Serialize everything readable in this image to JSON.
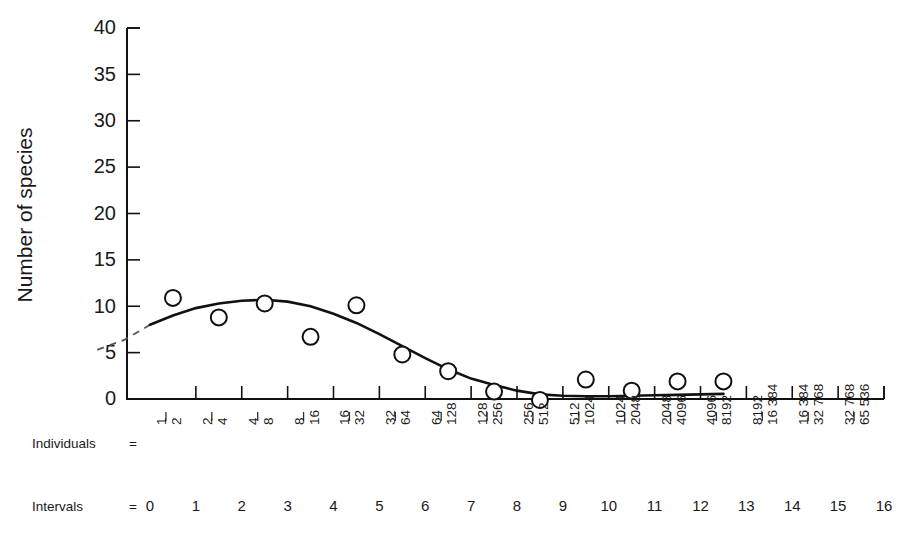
{
  "chart_data": {
    "type": "scatter",
    "title": "",
    "subtitle": "",
    "xlabel": "Intervals",
    "ylabel": "Number of species",
    "ylim": [
      0,
      40
    ],
    "yticks": [
      0,
      5,
      10,
      15,
      20,
      25,
      30,
      35,
      40
    ],
    "xlim": [
      0,
      16
    ],
    "grid": false,
    "legend": null,
    "x_axis_rows": [
      {
        "name": "individuals",
        "label": "Individuals",
        "equals": "=",
        "ticklabels": [
          {
            "upper": "1",
            "lower": "2"
          },
          {
            "upper": "2",
            "lower": "4"
          },
          {
            "upper": "4",
            "lower": "8"
          },
          {
            "upper": "8",
            "lower": "16"
          },
          {
            "upper": "16",
            "lower": "32"
          },
          {
            "upper": "32",
            "lower": "64"
          },
          {
            "upper": "64",
            "lower": "128"
          },
          {
            "upper": "128",
            "lower": "256"
          },
          {
            "upper": "256",
            "lower": "512"
          },
          {
            "upper": "512",
            "lower": "1024"
          },
          {
            "upper": "1024",
            "lower": "2048"
          },
          {
            "upper": "2048",
            "lower": "4096"
          },
          {
            "upper": "4096",
            "lower": "8192"
          },
          {
            "upper": "8192",
            "lower": "16 384"
          },
          {
            "upper": "16 384",
            "lower": "32 768"
          },
          {
            "upper": "32 768",
            "lower": "65 536"
          }
        ]
      },
      {
        "name": "intervals",
        "label": "Intervals",
        "equals": "=",
        "ticklabels": [
          "0",
          "1",
          "2",
          "3",
          "4",
          "5",
          "6",
          "7",
          "8",
          "9",
          "10",
          "11",
          "12",
          "13",
          "14",
          "15",
          "16"
        ]
      }
    ],
    "series": [
      {
        "name": "observed species counts",
        "marker": "open-circle",
        "points": [
          {
            "x": 0.5,
            "y": 10.9
          },
          {
            "x": 1.5,
            "y": 8.8
          },
          {
            "x": 2.5,
            "y": 10.3
          },
          {
            "x": 3.5,
            "y": 6.7
          },
          {
            "x": 4.5,
            "y": 10.1
          },
          {
            "x": 5.5,
            "y": 4.8
          },
          {
            "x": 6.5,
            "y": 3.0
          },
          {
            "x": 7.5,
            "y": 0.8
          },
          {
            "x": 8.5,
            "y": -0.1
          },
          {
            "x": 9.5,
            "y": 2.1
          },
          {
            "x": 10.5,
            "y": 0.9
          },
          {
            "x": 11.5,
            "y": 1.9
          },
          {
            "x": 12.5,
            "y": 1.9
          }
        ]
      },
      {
        "name": "fitted lognormal curve",
        "style": "solid",
        "points": [
          {
            "x": 0.0,
            "y": 8.0
          },
          {
            "x": 0.5,
            "y": 9.0
          },
          {
            "x": 1.0,
            "y": 9.8
          },
          {
            "x": 1.5,
            "y": 10.3
          },
          {
            "x": 2.0,
            "y": 10.6
          },
          {
            "x": 2.5,
            "y": 10.7
          },
          {
            "x": 3.0,
            "y": 10.5
          },
          {
            "x": 3.5,
            "y": 10.0
          },
          {
            "x": 4.0,
            "y": 9.2
          },
          {
            "x": 4.5,
            "y": 8.2
          },
          {
            "x": 5.0,
            "y": 7.0
          },
          {
            "x": 5.5,
            "y": 5.7
          },
          {
            "x": 6.0,
            "y": 4.4
          },
          {
            "x": 6.5,
            "y": 3.2
          },
          {
            "x": 7.0,
            "y": 2.2
          },
          {
            "x": 7.5,
            "y": 1.5
          },
          {
            "x": 8.0,
            "y": 0.9
          },
          {
            "x": 8.5,
            "y": 0.5
          },
          {
            "x": 9.0,
            "y": 0.35
          },
          {
            "x": 9.5,
            "y": 0.3
          },
          {
            "x": 10.0,
            "y": 0.3
          },
          {
            "x": 10.5,
            "y": 0.35
          },
          {
            "x": 11.0,
            "y": 0.4
          },
          {
            "x": 11.5,
            "y": 0.45
          },
          {
            "x": 12.0,
            "y": 0.5
          },
          {
            "x": 12.5,
            "y": 0.55
          }
        ]
      },
      {
        "name": "veil-line extension",
        "style": "dashed",
        "points": [
          {
            "x": -1.15,
            "y": 5.3
          },
          {
            "x": -0.55,
            "y": 6.4
          },
          {
            "x": 0.0,
            "y": 8.0
          }
        ]
      }
    ]
  },
  "colors": {
    "background": "#ffffff",
    "ink": "#111111",
    "dashed": "#555555"
  }
}
